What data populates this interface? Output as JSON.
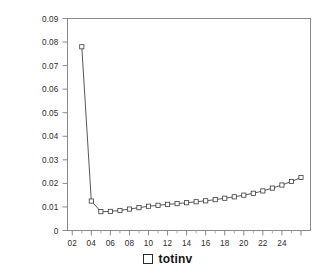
{
  "chart_data": {
    "type": "line",
    "title": "",
    "xlabel": "",
    "ylabel": "",
    "legend_position": "bottom",
    "grid": false,
    "marker": "open-square",
    "line_color": "#454545",
    "marker_fill": "#ffffff",
    "marker_edge": "#3a3a3a",
    "xlim": [
      1.5,
      27.0
    ],
    "ylim": [
      0,
      0.09
    ],
    "ytick_labels": [
      "0.09",
      "0.08",
      "0.07",
      "0.06",
      "0.05",
      "0.04",
      "0.03",
      "0.02",
      "0.01",
      "0"
    ],
    "ytick_values": [
      0.09,
      0.08,
      0.07,
      0.06,
      0.05,
      0.04,
      0.03,
      0.02,
      0.01,
      0
    ],
    "xtick_labels": [
      "02",
      "04",
      "06",
      "08",
      "10",
      "12",
      "14",
      "16",
      "18",
      "20",
      "22",
      "24"
    ],
    "xtick_values": [
      2,
      4,
      6,
      8,
      10,
      12,
      14,
      16,
      18,
      20,
      22,
      24
    ],
    "series": [
      {
        "name": "totinv",
        "x": [
          3,
          4,
          5,
          6,
          7,
          8,
          9,
          10,
          11,
          12,
          13,
          14,
          15,
          16,
          17,
          18,
          19,
          20,
          21,
          22,
          23,
          24,
          25,
          26
        ],
        "values": [
          0.078,
          0.0125,
          0.008,
          0.0081,
          0.0085,
          0.0091,
          0.0097,
          0.0103,
          0.0107,
          0.0111,
          0.0114,
          0.0118,
          0.0122,
          0.0126,
          0.0131,
          0.0137,
          0.0143,
          0.015,
          0.0158,
          0.0168,
          0.018,
          0.0193,
          0.0208,
          0.0225
        ]
      }
    ]
  },
  "legend": {
    "marker_name": "open-square-marker",
    "label": "totinv"
  }
}
